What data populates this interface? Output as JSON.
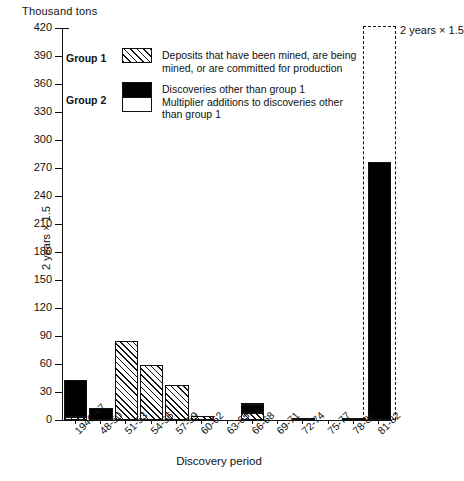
{
  "chart_data": {
    "type": "bar",
    "title": "",
    "ylabel": "Thousand tons",
    "xlabel": "Discovery period",
    "ylim": [
      0,
      420
    ],
    "ytick_step": 30,
    "yticks": [
      420,
      390,
      360,
      330,
      300,
      270,
      240,
      210,
      180,
      150,
      120,
      90,
      60,
      30,
      0
    ],
    "grid": false,
    "legend_position": "upper-left-inside",
    "categories": [
      "1946-47",
      "48-50",
      "51-53",
      "54-56",
      "57-59",
      "60-62",
      "63-65",
      "66-68",
      "69-71",
      "72-74",
      "75-77",
      "78-80",
      "81-82"
    ],
    "series": [
      {
        "name": "Group 1 — Deposits that have been mined, are being mined, or are committed for production",
        "pattern": "hatch",
        "values": [
          3,
          0,
          85,
          59,
          37,
          4,
          0,
          8,
          0,
          0,
          0,
          0,
          0
        ]
      },
      {
        "name": "Group 2 — Discoveries other than group 1",
        "pattern": "black",
        "values": [
          40,
          13,
          0,
          0,
          0,
          0,
          0,
          8,
          0,
          1,
          0,
          1,
          276
        ]
      },
      {
        "name": "Group 2 — Multiplier additions to discoveries other than group 1",
        "pattern": "white",
        "values": [
          0,
          0,
          0,
          0,
          0,
          0,
          0,
          2,
          0,
          0,
          0,
          0,
          0
        ]
      }
    ],
    "totals": [
      43,
      13,
      85,
      59,
      37,
      4,
      0,
      18,
      0,
      1,
      0,
      1,
      276
    ],
    "annotations": [
      {
        "text": "2 years  ×  1.5",
        "position": "left-of-first-bar",
        "orientation": "vertical"
      },
      {
        "text": "2 years  ×  1.5",
        "position": "right-of-last-bar",
        "orientation": "horizontal",
        "marker": "dashed-box"
      }
    ]
  },
  "axes": {
    "y_title": "Thousand tons",
    "x_title": "Discovery period",
    "y_ticks": [
      "420",
      "390",
      "360",
      "330",
      "300",
      "270",
      "240",
      "210",
      "180",
      "150",
      "120",
      "90",
      "60",
      "30",
      "0"
    ],
    "x_ticks": [
      "1946-47",
      "48-50",
      "51-53",
      "54-56",
      "57-59",
      "60-62",
      "63-65",
      "66-68",
      "69-71",
      "72-74",
      "75-77",
      "78-80",
      "81-82"
    ]
  },
  "legend": {
    "group1": {
      "label": "Group 1",
      "swatch": "hatched-swatch",
      "line1": "Deposits that have been mined, are being",
      "line2": "mined, or are committed for production"
    },
    "group2": {
      "label": "Group 2",
      "swatch_black": "black-swatch",
      "swatch_white": "white-swatch",
      "line1": "Discoveries other than group 1",
      "line2": "Multiplier additions to discoveries other",
      "line3": "than group 1"
    }
  },
  "annotations": {
    "left_note": "2 years  ×  1.5",
    "right_note": "2 years  ×  1.5"
  }
}
